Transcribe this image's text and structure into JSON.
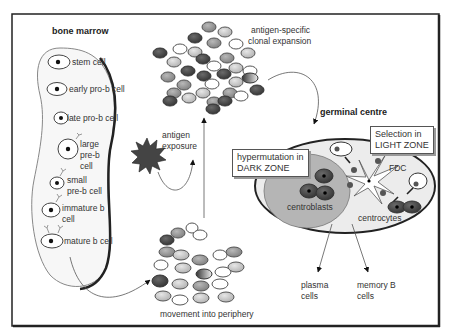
{
  "bone_marrow": {
    "title": "bone marrow",
    "stages": [
      {
        "label": "stem cell"
      },
      {
        "label": "early pro-b cell"
      },
      {
        "label": "late pro-b cell"
      },
      {
        "label": "large\npre-b\ncell",
        "lines": [
          "large",
          "pre-b",
          "cell"
        ]
      },
      {
        "label": "small\npre-b cell",
        "lines": [
          "small",
          "pre-b cell"
        ]
      },
      {
        "label": "immature b\ncell",
        "lines": [
          "immature b",
          "cell"
        ]
      },
      {
        "label": "mature b cell"
      }
    ]
  },
  "antigen": {
    "label_line1": "antigen",
    "label_line2": "exposure"
  },
  "clonal": {
    "label_line1": "antigen-specific",
    "label_line2": "clonal expansion"
  },
  "periphery": {
    "label": "movement into periphery"
  },
  "germinal_centre": {
    "title": "germinal centre",
    "dark_zone_box": {
      "line1": "hypermutation in",
      "line2": "DARK ZONE"
    },
    "light_zone_box": {
      "line1": "Selection in",
      "line2": "LIGHT ZONE"
    },
    "fdc_label": "FDC",
    "centroblasts_label": "centroblasts",
    "centrocytes_label": "centrocytes"
  },
  "outputs": {
    "plasma": {
      "line1": "plasma",
      "line2": "cells"
    },
    "memory": {
      "line1": "memory B",
      "line2": "cells"
    }
  },
  "colors": {
    "dark_cell": "#4a4a4a",
    "mid_cell": "#9a9a9a",
    "light_cell": "#c8c8c8",
    "white_cell": "#ffffff",
    "dark_zone_fill": "#b5b5b5",
    "light_zone_fill": "#ebebeb",
    "frame": "#222222"
  }
}
